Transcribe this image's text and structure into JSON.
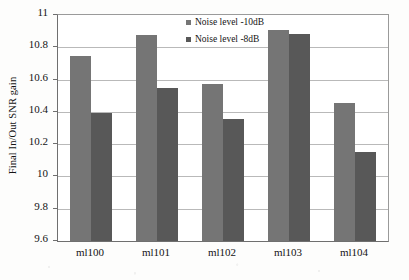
{
  "chart_data": {
    "type": "bar",
    "title": "",
    "xlabel": "",
    "ylabel": "Final In/Out SNR gain",
    "categories": [
      "ml100",
      "ml101",
      "ml102",
      "ml103",
      "ml104"
    ],
    "series": [
      {
        "name": "Noise level -10dB",
        "color": "#757575",
        "values": [
          10.745,
          10.875,
          10.575,
          10.91,
          10.455
        ]
      },
      {
        "name": "Noise level -8dB",
        "color": "#585858",
        "values": [
          10.39,
          10.55,
          10.355,
          10.88,
          10.15
        ]
      }
    ],
    "ylim": [
      9.6,
      11
    ],
    "ytick_labels": [
      "11",
      "10.8",
      "10.6",
      "10.4",
      "10.2",
      "10",
      "9.8",
      "9.6"
    ],
    "ytick_values": [
      11,
      10.8,
      10.6,
      10.4,
      10.2,
      10,
      9.8,
      9.6
    ],
    "grid": true,
    "grid_axis": "y",
    "legend_position": "top-center"
  }
}
